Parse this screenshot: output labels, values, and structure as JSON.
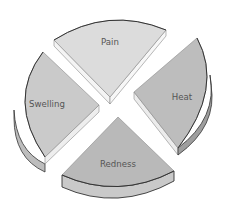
{
  "diagram": {
    "type": "exploded-3d-pie",
    "segments": [
      {
        "id": "pain",
        "label": "Pain",
        "position": "top",
        "top_color": "#dcdcdc",
        "side_color": "#f4f4f4"
      },
      {
        "id": "heat",
        "label": "Heat",
        "position": "right",
        "top_color": "#bdbdbd",
        "side_color": "#ececec"
      },
      {
        "id": "swelling",
        "label": "Swelling",
        "position": "left",
        "top_color": "#cacaca",
        "side_color": "#eeeeee"
      },
      {
        "id": "redness",
        "label": "Redness",
        "position": "bottom",
        "top_color": "#b9b9b9",
        "side_color": "#c9c9c9"
      }
    ],
    "outline_color": "#333333",
    "edge_color": "#8a8a8a"
  }
}
